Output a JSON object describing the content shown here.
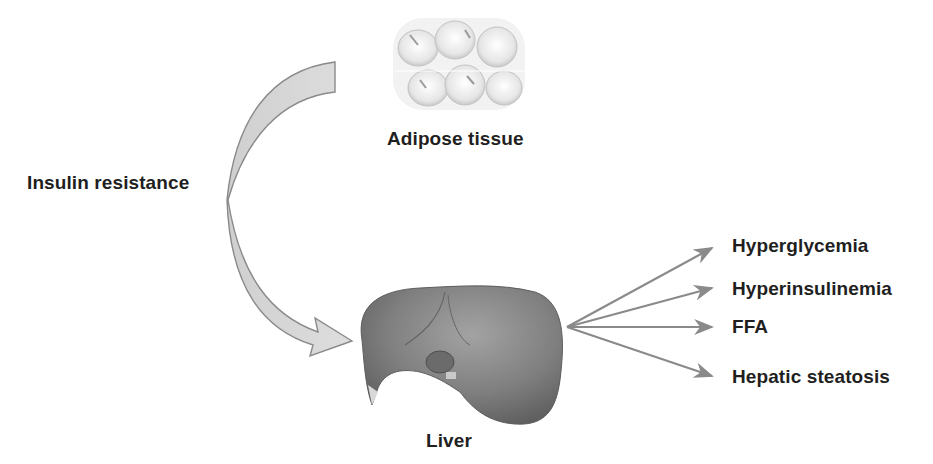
{
  "diagram": {
    "nodes": {
      "adipose": {
        "label": "Adipose tissue",
        "icon": "adipose-tissue-illustration"
      },
      "liver": {
        "label": "Liver",
        "icon": "liver-illustration"
      },
      "process": {
        "label": "Insulin resistance"
      }
    },
    "outcomes": [
      {
        "label": "Hyperglycemia"
      },
      {
        "label": "Hyperinsulinemia"
      },
      {
        "label": "FFA"
      },
      {
        "label": "Hepatic steatosis"
      }
    ],
    "edges": [
      {
        "from": "adipose",
        "to": "liver",
        "label": "Insulin resistance",
        "style": "curved-block-arrow"
      },
      {
        "from": "liver",
        "to": "Hyperglycemia"
      },
      {
        "from": "liver",
        "to": "Hyperinsulinemia"
      },
      {
        "from": "liver",
        "to": "FFA"
      },
      {
        "from": "liver",
        "to": "Hepatic steatosis"
      }
    ],
    "colors": {
      "arrow_fill": "#d2d2d2",
      "arrow_stroke": "#8a8a8a",
      "liver": "#7d7d7d",
      "text": "#1f1f1f"
    }
  }
}
